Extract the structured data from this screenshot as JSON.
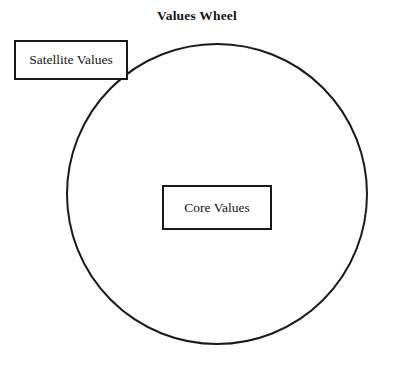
{
  "diagram": {
    "title": "Values Wheel",
    "type": "concentric-wheel",
    "background_color": "#ffffff",
    "stroke_color": "#1a1a1a",
    "text_color": "#141414",
    "wheel": {
      "name": "values-wheel",
      "shape": "circle",
      "center_x": 217,
      "center_y": 194,
      "radius": 161,
      "stroke_width": 2,
      "fill": "none"
    },
    "nodes": [
      {
        "id": "satellite-values",
        "label": "Satellite Values",
        "shape": "rectangle",
        "x": 14,
        "y": 40,
        "width": 114,
        "height": 40,
        "position": "outer-upper-left-overlapping-rim"
      },
      {
        "id": "core-values",
        "label": "Core Values",
        "shape": "rectangle",
        "x": 162,
        "y": 185,
        "width": 110,
        "height": 45,
        "position": "center-of-wheel"
      }
    ]
  }
}
